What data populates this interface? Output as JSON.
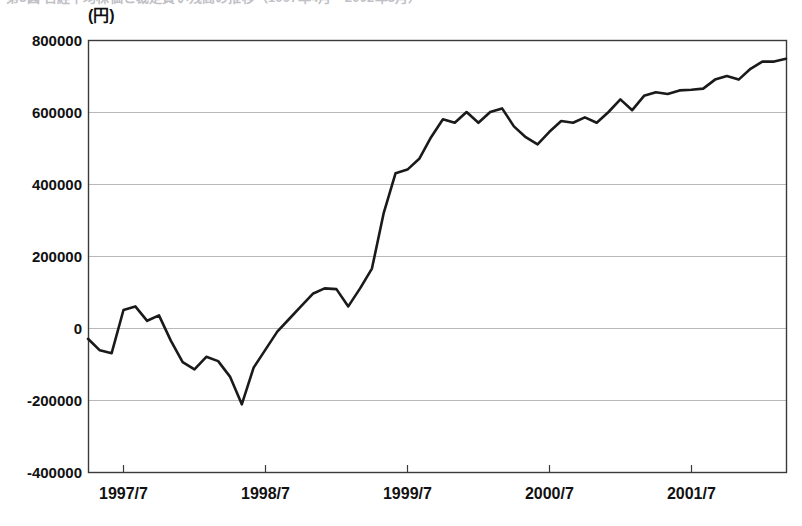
{
  "figure": {
    "top_caption_fragment": "第3図 日経平均株価と裁定買い残高の推移（1997年4月〜2002年3月）",
    "y_unit_label": "(円)",
    "background_color": "#ffffff",
    "line_color": "#1a1a1a",
    "grid_color": "#b9b9b9",
    "axis_color": "#3a3a3a"
  },
  "chart_data": {
    "type": "line",
    "title": "",
    "subtitle": "",
    "xlabel": "",
    "ylabel": "(円)",
    "ylim": [
      -400000,
      800000
    ],
    "ytick_labels": [
      "800000",
      "600000",
      "400000",
      "200000",
      "0",
      "-200000",
      "-400000"
    ],
    "ytick_values": [
      800000,
      600000,
      400000,
      200000,
      0,
      -200000,
      -400000
    ],
    "xtick_labels": [
      "1997/7",
      "1998/7",
      "1999/7",
      "2000/7",
      "2001/7"
    ],
    "xtick_positions": [
      3,
      15,
      27,
      39,
      51
    ],
    "grid": true,
    "grid_axis": "y",
    "legend": false,
    "legend_position": "none",
    "x_index_range": [
      0,
      59
    ],
    "series": [
      {
        "name": "値",
        "color": "#1a1a1a",
        "values": [
          -30000,
          -62000,
          -70000,
          50000,
          60000,
          20000,
          35000,
          -35000,
          -95000,
          -115000,
          -80000,
          -92000,
          -135000,
          -212000,
          -110000,
          -60000,
          -10000,
          25000,
          60000,
          95000,
          110000,
          108000,
          60000,
          110000,
          165000,
          320000,
          430000,
          440000,
          470000,
          530000,
          580000,
          570000,
          600000,
          570000,
          600000,
          610000,
          560000,
          530000,
          510000,
          545000,
          575000,
          570000,
          585000,
          570000,
          600000,
          635000,
          605000,
          645000,
          655000,
          650000,
          660000,
          662000,
          665000,
          690000,
          700000,
          690000,
          720000,
          740000,
          740000,
          748000
        ]
      }
    ]
  }
}
